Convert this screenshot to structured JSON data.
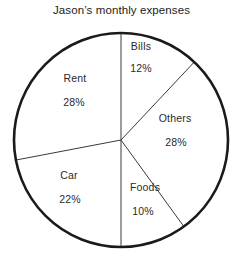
{
  "chart_data": {
    "type": "pie",
    "title": "Jason’s monthly expenses",
    "categories": [
      "Bills",
      "Others",
      "Foods",
      "Car",
      "Rent"
    ],
    "values": [
      12,
      28,
      10,
      22,
      28
    ],
    "value_labels": [
      "12%",
      "28%",
      "10%",
      "22%",
      "28%"
    ],
    "unit": "%",
    "total": 100,
    "start_angle_deg": 0,
    "direction": "clockwise",
    "legend": "none",
    "grid": false,
    "slice_fill": "#ffffff",
    "outline_color": "#1a1a1a",
    "divider_color": "#3a3a3a",
    "text_color": "#2a2a2a",
    "background": "#ffffff"
  },
  "chart": {
    "title": "Jason’s monthly expenses",
    "geometry": {
      "center_x": 121,
      "center_y": 140,
      "radius": 107,
      "outline_width": 2.6,
      "divider_width": 1
    },
    "slices": [
      {
        "name": "Bills",
        "label": "Bills",
        "value_label": "12%",
        "value": 12,
        "label_x": 141,
        "label_y": 46,
        "value_x": 141,
        "value_y": 68
      },
      {
        "name": "Others",
        "label": "Others",
        "value_label": "28%",
        "value": 28,
        "label_x": 175,
        "label_y": 118,
        "value_x": 176,
        "value_y": 142
      },
      {
        "name": "Foods",
        "label": "Foods",
        "value_label": "10%",
        "value": 10,
        "label_x": 145,
        "label_y": 187,
        "value_x": 143,
        "value_y": 211
      },
      {
        "name": "Car",
        "label": "Car",
        "value_label": "22%",
        "value": 22,
        "label_x": 69,
        "label_y": 175,
        "value_x": 70,
        "value_y": 199
      },
      {
        "name": "Rent",
        "label": "Rent",
        "value_label": "28%",
        "value": 28,
        "label_x": 75,
        "label_y": 78,
        "value_x": 74,
        "value_y": 102
      }
    ]
  }
}
